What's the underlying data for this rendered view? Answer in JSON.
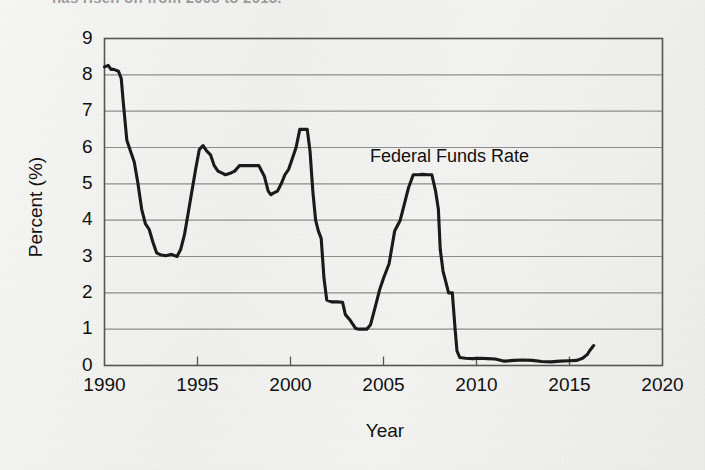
{
  "figure": {
    "caption_partial": "has risen on from 2008 to 2015.",
    "background_color": "#f2f2f0",
    "line_color": "#1a1a1a",
    "grid_color": "#8c8c8c",
    "axis_color": "#555555"
  },
  "annotations": {
    "series_label": "Federal Funds Rate"
  },
  "chart_data": {
    "type": "line",
    "title": "",
    "xlabel": "Year",
    "ylabel": "Percent (%)",
    "xlim": [
      1990,
      2020
    ],
    "ylim": [
      0,
      9
    ],
    "xticks": [
      1990,
      1995,
      2000,
      2005,
      2010,
      2015,
      2020
    ],
    "xtick_labels": [
      "1990",
      "1995",
      "2000",
      "2005",
      "2010",
      "2015",
      "2020"
    ],
    "yticks": [
      0,
      1,
      2,
      3,
      4,
      5,
      6,
      7,
      8,
      9
    ],
    "ytick_labels": [
      "0",
      "1",
      "2",
      "3",
      "4",
      "5",
      "6",
      "7",
      "8",
      "9"
    ],
    "grid": "horizontal",
    "legend": "none",
    "series": [
      {
        "name": "Federal Funds Rate",
        "units": "percent",
        "x": [
          1990.0,
          1990.2,
          1990.35,
          1990.5,
          1990.6,
          1990.75,
          1990.9,
          1991.0,
          1991.2,
          1991.4,
          1991.6,
          1991.8,
          1992.0,
          1992.2,
          1992.4,
          1992.6,
          1992.8,
          1993.0,
          1993.3,
          1993.6,
          1993.9,
          1994.1,
          1994.3,
          1994.5,
          1994.7,
          1994.9,
          1995.1,
          1995.3,
          1995.5,
          1995.7,
          1995.9,
          1996.1,
          1996.3,
          1996.5,
          1996.8,
          1997.0,
          1997.25,
          1997.5,
          1997.75,
          1998.0,
          1998.3,
          1998.6,
          1998.8,
          1998.95,
          1999.1,
          1999.3,
          1999.5,
          1999.7,
          1999.9,
          2000.1,
          2000.3,
          2000.5,
          2000.7,
          2000.9,
          2001.05,
          2001.2,
          2001.35,
          2001.5,
          2001.65,
          2001.8,
          2001.95,
          2002.2,
          2002.5,
          2002.8,
          2002.95,
          2003.2,
          2003.5,
          2003.7,
          2003.9,
          2004.1,
          2004.3,
          2004.55,
          2004.8,
          2005.0,
          2005.3,
          2005.6,
          2005.9,
          2006.1,
          2006.35,
          2006.6,
          2006.9,
          2007.1,
          2007.35,
          2007.6,
          2007.8,
          2007.95,
          2008.05,
          2008.2,
          2008.35,
          2008.5,
          2008.7,
          2008.85,
          2008.95,
          2009.1,
          2009.4,
          2009.8,
          2010.2,
          2010.6,
          2011.0,
          2011.5,
          2012.0,
          2012.5,
          2013.0,
          2013.5,
          2014.0,
          2014.5,
          2015.0,
          2015.4,
          2015.7,
          2015.95,
          2016.1,
          2016.3
        ],
        "y": [
          8.22,
          8.26,
          8.15,
          8.15,
          8.13,
          8.1,
          7.9,
          7.3,
          6.2,
          5.9,
          5.6,
          5.0,
          4.3,
          3.9,
          3.75,
          3.4,
          3.1,
          3.05,
          3.02,
          3.06,
          3.0,
          3.2,
          3.6,
          4.2,
          4.8,
          5.4,
          5.95,
          6.05,
          5.9,
          5.8,
          5.5,
          5.35,
          5.3,
          5.25,
          5.3,
          5.35,
          5.5,
          5.5,
          5.5,
          5.5,
          5.5,
          5.2,
          4.8,
          4.7,
          4.75,
          4.8,
          5.0,
          5.25,
          5.4,
          5.7,
          6.0,
          6.5,
          6.5,
          6.5,
          5.9,
          4.8,
          4.0,
          3.7,
          3.5,
          2.4,
          1.8,
          1.75,
          1.75,
          1.74,
          1.4,
          1.25,
          1.02,
          1.0,
          1.0,
          1.0,
          1.12,
          1.6,
          2.1,
          2.4,
          2.8,
          3.7,
          4.0,
          4.4,
          4.9,
          5.25,
          5.25,
          5.26,
          5.25,
          5.25,
          4.8,
          4.3,
          3.2,
          2.6,
          2.3,
          2.0,
          2.0,
          1.0,
          0.4,
          0.22,
          0.2,
          0.19,
          0.2,
          0.19,
          0.18,
          0.12,
          0.14,
          0.15,
          0.14,
          0.11,
          0.1,
          0.12,
          0.13,
          0.14,
          0.2,
          0.3,
          0.42,
          0.55
        ]
      }
    ]
  }
}
